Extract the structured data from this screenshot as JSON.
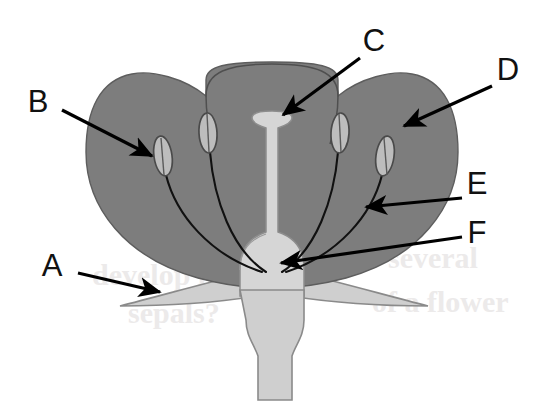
{
  "figure": {
    "kind": "botanical-cross-section",
    "width": 544,
    "height": 413,
    "background_color": "#ffffff"
  },
  "colors": {
    "corolla_fill": "#7d7d7d",
    "corolla_stroke": "#5d5d5d",
    "pistil_fill": "#d6d6d6",
    "pistil_stroke": "#8d8d8d",
    "sepal_fill": "#cfcfcf",
    "sepal_stroke": "#8a8a8a",
    "anther_fill": "#bdbdbd",
    "anther_stroke": "#4a4a4a",
    "filament_stroke": "#111111",
    "label_color": "#111111",
    "leader_color": "#000000",
    "ghost_text_color": "#eceaea"
  },
  "labels": [
    {
      "id": "A",
      "text": "A",
      "text_x": 52,
      "text_y": 276,
      "points_to": "sepal",
      "leader_start_x": 78,
      "leader_start_y": 273,
      "leader_end_x": 160,
      "leader_end_y": 292
    },
    {
      "id": "B",
      "text": "B",
      "text_x": 38,
      "text_y": 112,
      "points_to": "anther",
      "leader_start_x": 62,
      "leader_start_y": 110,
      "leader_end_x": 152,
      "leader_end_y": 156
    },
    {
      "id": "C",
      "text": "C",
      "text_x": 362,
      "text_y": 51,
      "points_to": "stigma",
      "leader_start_x": 360,
      "leader_start_y": 58,
      "leader_end_x": 283,
      "leader_end_y": 115
    },
    {
      "id": "D",
      "text": "D",
      "text_x": 497,
      "text_y": 80,
      "points_to": "petal-corolla",
      "leader_start_x": 492,
      "leader_start_y": 86,
      "leader_end_x": 404,
      "leader_end_y": 126
    },
    {
      "id": "E",
      "text": "E",
      "text_x": 467,
      "text_y": 194,
      "points_to": "filament",
      "leader_start_x": 462,
      "leader_start_y": 198,
      "leader_end_x": 366,
      "leader_end_y": 207
    },
    {
      "id": "F",
      "text": "F",
      "text_x": 467,
      "text_y": 243,
      "points_to": "ovary",
      "leader_start_x": 462,
      "leader_start_y": 237,
      "leader_end_x": 281,
      "leader_end_y": 263
    }
  ],
  "parts": {
    "corolla": "petal",
    "pistil_stigma": "stigma",
    "pistil_style": "style",
    "pistil_ovary": "ovary",
    "sepal": "sepal",
    "pedicel": "pedicel",
    "anther_count": 4
  },
  "ghost_text": [
    {
      "text": "develop in",
      "x": 92,
      "y": 285,
      "rotate": 0
    },
    {
      "text": "sepals?",
      "x": 128,
      "y": 323,
      "rotate": 0
    },
    {
      "text": "several",
      "x": 388,
      "y": 268,
      "rotate": 0
    },
    {
      "text": "of a flower",
      "x": 372,
      "y": 312,
      "rotate": 0
    }
  ]
}
